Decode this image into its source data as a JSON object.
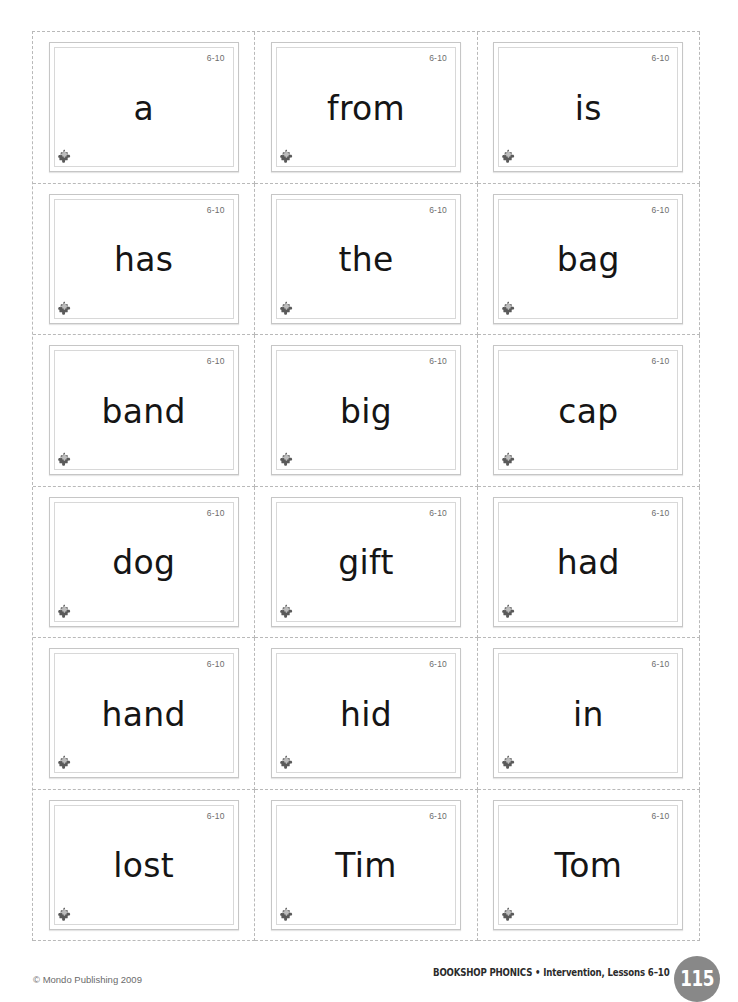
{
  "document": {
    "type": "phonics-word-card-worksheet",
    "columns": 3,
    "rows": 6
  },
  "cards": [
    {
      "word": "a",
      "lesson": "6-10",
      "logo": "puzzle-piece-icon"
    },
    {
      "word": "from",
      "lesson": "6-10",
      "logo": "puzzle-piece-icon"
    },
    {
      "word": "is",
      "lesson": "6-10",
      "logo": "puzzle-piece-icon"
    },
    {
      "word": "has",
      "lesson": "6-10",
      "logo": "puzzle-piece-icon"
    },
    {
      "word": "the",
      "lesson": "6-10",
      "logo": "puzzle-piece-icon"
    },
    {
      "word": "bag",
      "lesson": "6-10",
      "logo": "puzzle-piece-icon"
    },
    {
      "word": "band",
      "lesson": "6-10",
      "logo": "puzzle-piece-icon"
    },
    {
      "word": "big",
      "lesson": "6-10",
      "logo": "puzzle-piece-icon"
    },
    {
      "word": "cap",
      "lesson": "6-10",
      "logo": "puzzle-piece-icon"
    },
    {
      "word": "dog",
      "lesson": "6-10",
      "logo": "puzzle-piece-icon"
    },
    {
      "word": "gift",
      "lesson": "6-10",
      "logo": "puzzle-piece-icon"
    },
    {
      "word": "had",
      "lesson": "6-10",
      "logo": "puzzle-piece-icon"
    },
    {
      "word": "hand",
      "lesson": "6-10",
      "logo": "puzzle-piece-icon"
    },
    {
      "word": "hid",
      "lesson": "6-10",
      "logo": "puzzle-piece-icon"
    },
    {
      "word": "in",
      "lesson": "6-10",
      "logo": "puzzle-piece-icon"
    },
    {
      "word": "lost",
      "lesson": "6-10",
      "logo": "puzzle-piece-icon"
    },
    {
      "word": "Tim",
      "lesson": "6-10",
      "logo": "puzzle-piece-icon"
    },
    {
      "word": "Tom",
      "lesson": "6-10",
      "logo": "puzzle-piece-icon"
    }
  ],
  "footer": {
    "copyright": "© Mondo Publishing 2009",
    "series": "BOOKSHOP PHONICS • Intervention, Lessons 6–10",
    "page_number": "115"
  },
  "colors": {
    "badge": "#888888",
    "card_border": "#c6c6c6",
    "card_inner_border": "#d8d8d8",
    "cut_line": "#b9b9b9",
    "word_text": "#151515",
    "lesson_text": "#6d6d6d"
  }
}
